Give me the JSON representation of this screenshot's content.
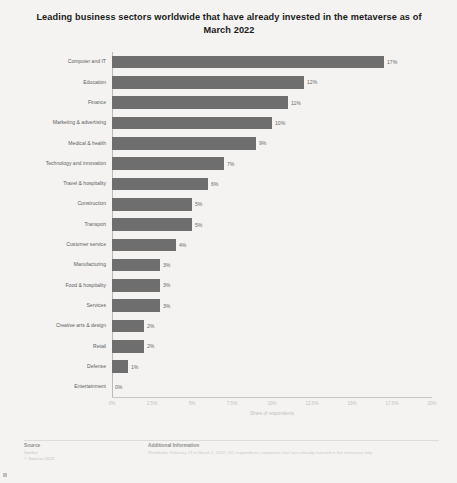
{
  "chart_data": {
    "type": "bar",
    "orientation": "horizontal",
    "title": "Leading business sectors worldwide that have already invested in the metaverse as of March 2022",
    "xlabel": "Share of respondents",
    "ylabel": "",
    "xlim": [
      0,
      20
    ],
    "grid": false,
    "legend": null,
    "categories": [
      "Computer and IT",
      "Education",
      "Finance",
      "Marketing & advertising",
      "Medical & health",
      "Technology and innovation",
      "Travel & hospitality",
      "Construction",
      "Transport",
      "Customer service",
      "Manufacturing",
      "Food & hospitality",
      "Services",
      "Creative arts & design",
      "Retail",
      "Defense",
      "Entertainment"
    ],
    "values": [
      17,
      12,
      11,
      10,
      9,
      7,
      6,
      5,
      5,
      4,
      3,
      3,
      3,
      2,
      2,
      1,
      0
    ],
    "value_labels": [
      "17%",
      "12%",
      "11%",
      "10%",
      "9%",
      "7%",
      "6%",
      "5%",
      "5%",
      "4%",
      "3%",
      "3%",
      "3%",
      "2%",
      "2%",
      "1%",
      "0%"
    ],
    "xticks": [
      0,
      2.5,
      5,
      7.5,
      10,
      12.5,
      15,
      17.5,
      20
    ],
    "xtick_labels": [
      "0%",
      "2.5%",
      "5%",
      "7.5%",
      "10%",
      "12.5%",
      "15%",
      "17.5%",
      "20%"
    ],
    "bar_color": "#6e6e6e"
  },
  "footer": {
    "source_heading": "Source",
    "source_name": "Sortlist",
    "copyright": "© Statista 2023",
    "info_heading": "Additional Information",
    "info_text": "Worldwide; February 23 to March 1, 2022; 201 respondents; companies that have already invested in the metaverse only"
  }
}
